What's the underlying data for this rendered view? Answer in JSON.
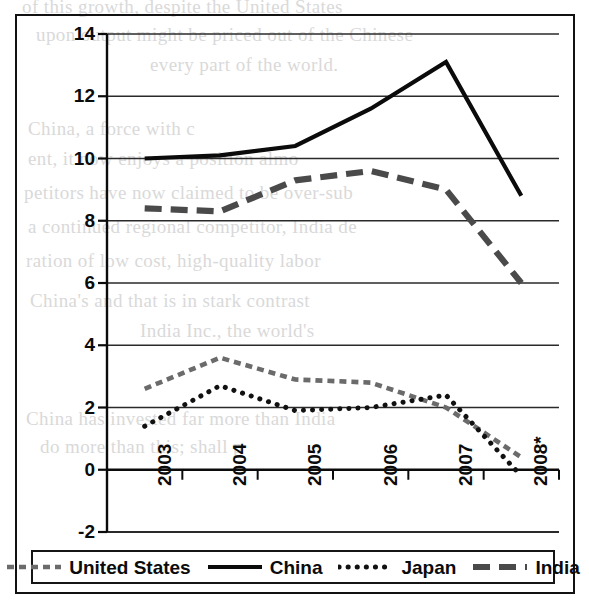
{
  "chart_data": {
    "type": "line",
    "title": "",
    "subtitle": "",
    "xlabel": "",
    "ylabel": "",
    "x": [
      "2003",
      "2004",
      "2005",
      "2006",
      "2007",
      "2008*"
    ],
    "categories": [
      "2003",
      "2004",
      "2005",
      "2006",
      "2007",
      "2008*"
    ],
    "ylim": [
      -2,
      14
    ],
    "yticks": [
      "14",
      "12",
      "10",
      "8",
      "6",
      "4",
      "2",
      "0",
      "-2"
    ],
    "ytick_values": [
      14,
      12,
      10,
      8,
      6,
      4,
      2,
      0,
      -2
    ],
    "grid": true,
    "legend_position": "bottom",
    "series": [
      {
        "name": "United States",
        "values": [
          2.6,
          3.6,
          2.9,
          2.8,
          2.0,
          0.4
        ],
        "style": "short-dash",
        "color": "#6b6b6b"
      },
      {
        "name": "China",
        "values": [
          10.0,
          10.1,
          10.4,
          11.6,
          13.1,
          8.8
        ],
        "style": "solid",
        "color": "#0b0b0b"
      },
      {
        "name": "Japan",
        "values": [
          1.4,
          2.7,
          1.9,
          2.0,
          2.4,
          -0.2
        ],
        "style": "dotted",
        "color": "#111111"
      },
      {
        "name": "India",
        "values": [
          8.4,
          8.3,
          9.3,
          9.6,
          9.0,
          6.0
        ],
        "style": "long-dash",
        "color": "#4a4a4a"
      }
    ]
  },
  "legend": {
    "entries": [
      {
        "label": "United States",
        "swatch": "short-dash-swatch"
      },
      {
        "label": "China",
        "swatch": "solid-line-swatch"
      },
      {
        "label": "Japan",
        "swatch": "dotted-line-swatch"
      },
      {
        "label": "India",
        "swatch": "long-dash-swatch"
      }
    ]
  },
  "colors": {
    "axis": "#0b0b0b",
    "gridline": "#2a2a2a",
    "frame": "#121212",
    "background": "#ffffff"
  },
  "bleed_text": [
    "of this growth, despite the United States",
    "upon output might be priced out of the Chinese",
    "every part of the world.",
    "China, a force with c",
    "ent, it now enjoys a position almo",
    "petitors have now claimed to be over-sub",
    "a continued regional competitor, India de",
    "ration of low cost, high-quality labor",
    "China's and that is in stark contrast",
    "India Inc., the world's",
    "China has invested far more than India",
    "do more than this; shall p"
  ]
}
